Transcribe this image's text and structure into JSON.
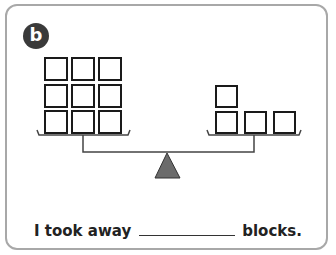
{
  "badge": {
    "label": "b"
  },
  "sentence": {
    "prefix": "I took away",
    "suffix": "blocks.",
    "blank_value": ""
  },
  "scale": {
    "left_pan": {
      "blocks": 9,
      "arrangement": "3x3 grid"
    },
    "right_pan": {
      "blocks": 4,
      "arrangement": "1 on top, 3 on bottom row"
    },
    "fulcrum_color": "#6b6b6b"
  }
}
